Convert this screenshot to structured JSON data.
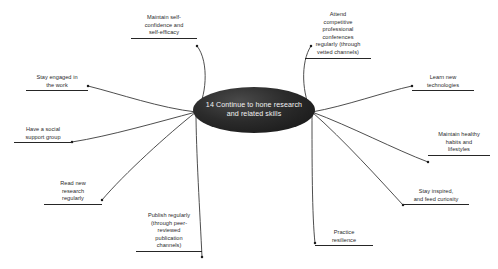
{
  "diagram": {
    "type": "mind-map",
    "background_color": "#ffffff",
    "center": {
      "id": "center-node",
      "label": "14 Continue to hone research and related skills",
      "shape": "ellipse",
      "fill_color": "#1e1e1e",
      "text_color": "#f2f2f2"
    },
    "branch_color": "#262626",
    "branches": [
      {
        "id": "maintain-self-confidence",
        "label": "Maintain self-\nconfidence and\nself-efficacy",
        "side": "top-left",
        "x": 131,
        "y": 14,
        "width": 66
      },
      {
        "id": "attend-conferences",
        "label": "Attend\ncompetitive\nprofessional\nconferences\nregularly (through\nvetted channels)",
        "side": "top-right",
        "x": 305,
        "y": 11,
        "width": 66
      },
      {
        "id": "stay-engaged",
        "label": "Stay engaged in\nthe work",
        "side": "left-upper",
        "x": 26,
        "y": 74,
        "width": 62
      },
      {
        "id": "learn-new-technologies",
        "label": "Learn new\ntechnologies",
        "side": "right-upper",
        "x": 412,
        "y": 74,
        "width": 62
      },
      {
        "id": "social-support-group",
        "label": "Have a social\nsupport group",
        "side": "left-middle",
        "x": 14,
        "y": 126,
        "width": 58
      },
      {
        "id": "maintain-healthy-habits",
        "label": "Maintain healthy\nhabits and\nlifestyles",
        "side": "right-middle",
        "x": 428,
        "y": 131,
        "width": 62
      },
      {
        "id": "read-new-research",
        "label": "Read new\nresearch\nregularly",
        "side": "left-lower",
        "x": 44,
        "y": 180,
        "width": 58
      },
      {
        "id": "stay-inspired",
        "label": "Stay inspired,\nand feed curiosity",
        "side": "right-lower",
        "x": 403,
        "y": 188,
        "width": 66
      },
      {
        "id": "publish-regularly",
        "label": "Publish regularly\n(through peer-\nreviewed\npublication\nchannels)",
        "side": "bottom-left",
        "x": 136,
        "y": 212,
        "width": 66
      },
      {
        "id": "practice-resilience",
        "label": "Practice\nresilience",
        "side": "bottom-right",
        "x": 315,
        "y": 229,
        "width": 58
      }
    ]
  }
}
